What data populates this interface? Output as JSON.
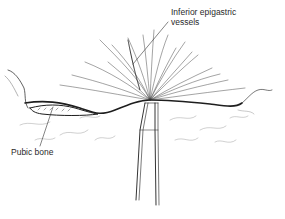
{
  "figure": {
    "type": "medical line illustration",
    "background": "#ffffff",
    "ink_color": "#1e1e1e"
  },
  "labels": [
    {
      "id": "inferior-epigastric-vessels",
      "line1": "Inferior epigastric",
      "line2": "vessels"
    },
    {
      "id": "pubic-bone",
      "text": "Pubic bone"
    }
  ]
}
